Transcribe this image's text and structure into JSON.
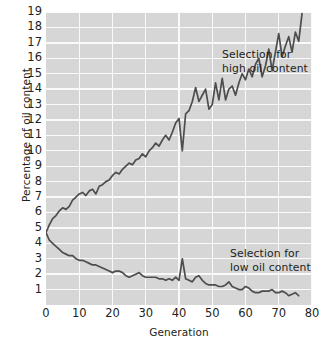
{
  "chart_data": {
    "type": "line",
    "title": "",
    "xlabel": "Generation",
    "ylabel": "Percentage of oil content",
    "xlim": [
      0,
      80
    ],
    "ylim": [
      0,
      19
    ],
    "grid": true,
    "legend_position": "inline-annotations",
    "xticks": [
      0,
      10,
      20,
      30,
      40,
      50,
      60,
      70,
      80
    ],
    "yticks": [
      1,
      2,
      3,
      4,
      5,
      6,
      7,
      8,
      9,
      10,
      11,
      12,
      13,
      14,
      15,
      16,
      17,
      18,
      19
    ],
    "annotations": [
      {
        "name": "high-selection-label",
        "text": "Selection for\nhigh oil content",
        "x": 45,
        "y": 16.6
      },
      {
        "name": "low-selection-label",
        "text": "Selection for\nlow oil content",
        "x": 48,
        "y": 3.6
      }
    ],
    "series": [
      {
        "name": "Selection for high oil content",
        "color": "#4d4d4d",
        "x": [
          0,
          1,
          2,
          3,
          4,
          5,
          6,
          7,
          8,
          9,
          10,
          11,
          12,
          13,
          14,
          15,
          16,
          17,
          18,
          19,
          20,
          21,
          22,
          23,
          24,
          25,
          26,
          27,
          28,
          29,
          30,
          31,
          32,
          33,
          34,
          35,
          36,
          37,
          38,
          39,
          40,
          41,
          42,
          43,
          44,
          45,
          46,
          47,
          48,
          49,
          50,
          51,
          52,
          53,
          54,
          55,
          56,
          57,
          58,
          59,
          60,
          61,
          62,
          63,
          64,
          65,
          66,
          67,
          68,
          69,
          70,
          71,
          72,
          73,
          74,
          75,
          76,
          77
        ],
        "values": [
          4.7,
          5.2,
          5.6,
          5.8,
          6.1,
          6.3,
          6.2,
          6.4,
          6.8,
          7.0,
          7.2,
          7.3,
          7.1,
          7.4,
          7.5,
          7.2,
          7.7,
          7.8,
          8.0,
          8.1,
          8.4,
          8.6,
          8.5,
          8.8,
          9.0,
          9.2,
          9.1,
          9.4,
          9.5,
          9.8,
          9.6,
          10.0,
          10.2,
          10.5,
          10.3,
          10.7,
          11.0,
          10.7,
          11.2,
          11.8,
          12.1,
          10.0,
          12.4,
          12.6,
          13.2,
          14.1,
          13.2,
          13.6,
          14.0,
          12.7,
          13.0,
          14.4,
          13.3,
          14.7,
          13.3,
          14.0,
          14.2,
          13.6,
          14.4,
          15.0,
          14.6,
          15.3,
          14.8,
          15.6,
          16.0,
          14.8,
          15.5,
          16.6,
          15.2,
          16.4,
          17.6,
          16.1,
          16.8,
          17.4,
          16.4,
          17.7,
          17.1,
          18.9
        ]
      },
      {
        "name": "Selection for low oil content",
        "color": "#4d4d4d",
        "x": [
          0,
          1,
          2,
          3,
          4,
          5,
          6,
          7,
          8,
          9,
          10,
          11,
          12,
          13,
          14,
          15,
          16,
          17,
          18,
          19,
          20,
          21,
          22,
          23,
          24,
          25,
          26,
          27,
          28,
          29,
          30,
          31,
          32,
          33,
          34,
          35,
          36,
          37,
          38,
          39,
          40,
          41,
          42,
          43,
          44,
          45,
          46,
          47,
          48,
          49,
          50,
          51,
          52,
          53,
          54,
          55,
          56,
          57,
          58,
          59,
          60,
          61,
          62,
          63,
          64,
          65,
          66,
          67,
          68,
          69,
          70,
          71,
          72,
          73,
          74,
          75,
          76
        ],
        "values": [
          4.7,
          4.2,
          4.0,
          3.8,
          3.6,
          3.4,
          3.3,
          3.2,
          3.2,
          3.0,
          2.9,
          2.9,
          2.8,
          2.7,
          2.6,
          2.6,
          2.5,
          2.4,
          2.3,
          2.2,
          2.1,
          2.2,
          2.2,
          2.1,
          1.9,
          1.8,
          1.9,
          2.0,
          2.1,
          1.9,
          1.8,
          1.8,
          1.8,
          1.8,
          1.7,
          1.7,
          1.6,
          1.7,
          1.6,
          1.8,
          1.6,
          3.0,
          1.7,
          1.6,
          1.5,
          1.8,
          1.9,
          1.6,
          1.4,
          1.3,
          1.3,
          1.3,
          1.2,
          1.2,
          1.3,
          1.5,
          1.2,
          1.1,
          1.0,
          1.0,
          1.2,
          1.1,
          0.9,
          0.8,
          0.8,
          0.9,
          0.9,
          0.9,
          1.0,
          0.8,
          0.8,
          0.9,
          0.8,
          0.6,
          0.7,
          0.8,
          0.6
        ]
      }
    ]
  }
}
